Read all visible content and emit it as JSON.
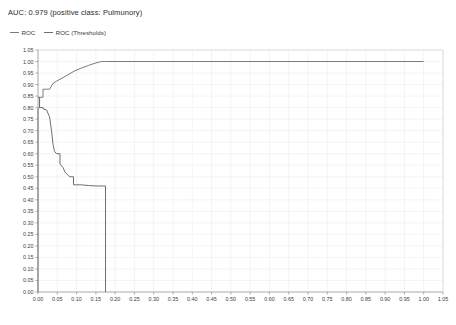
{
  "chart_data": {
    "type": "line",
    "title": "AUC: 0.979 (positive class: Pulmunory)",
    "xlabel": "",
    "ylabel": "",
    "xlim": [
      0.0,
      1.05
    ],
    "ylim": [
      0.0,
      1.05
    ],
    "grid": true,
    "legend_position": "top-left",
    "x_ticks": [
      "0.00",
      "0.05",
      "0.10",
      "0.15",
      "0.20",
      "0.25",
      "0.30",
      "0.35",
      "0.40",
      "0.45",
      "0.50",
      "0.55",
      "0.60",
      "0.65",
      "0.70",
      "0.75",
      "0.80",
      "0.85",
      "0.90",
      "0.95",
      "1.00",
      "1.05"
    ],
    "y_ticks": [
      "0.00",
      "0.05",
      "0.10",
      "0.15",
      "0.20",
      "0.25",
      "0.30",
      "0.35",
      "0.40",
      "0.45",
      "0.50",
      "0.55",
      "0.60",
      "0.65",
      "0.70",
      "0.75",
      "0.80",
      "0.85",
      "0.90",
      "0.95",
      "1.00",
      "1.05"
    ],
    "series": [
      {
        "name": "ROC",
        "color": "#7a7a7a",
        "points": [
          [
            0.0,
            0.0
          ],
          [
            0.0,
            0.795
          ],
          [
            0.004,
            0.8
          ],
          [
            0.004,
            0.845
          ],
          [
            0.013,
            0.845
          ],
          [
            0.013,
            0.88
          ],
          [
            0.022,
            0.88
          ],
          [
            0.03,
            0.88
          ],
          [
            0.039,
            0.905
          ],
          [
            0.048,
            0.915
          ],
          [
            0.057,
            0.923
          ],
          [
            0.07,
            0.935
          ],
          [
            0.083,
            0.948
          ],
          [
            0.096,
            0.96
          ],
          [
            0.113,
            0.972
          ],
          [
            0.131,
            0.983
          ],
          [
            0.148,
            0.993
          ],
          [
            0.165,
            1.0
          ],
          [
            0.175,
            1.0
          ],
          [
            0.3,
            1.0
          ],
          [
            0.5,
            1.0
          ],
          [
            0.7,
            1.0
          ],
          [
            1.0,
            1.0
          ]
        ]
      },
      {
        "name": "ROC (Thresholds)",
        "color": "#6e6e6e",
        "points": [
          [
            0.0,
            0.845
          ],
          [
            0.004,
            0.845
          ],
          [
            0.004,
            0.8
          ],
          [
            0.013,
            0.8
          ],
          [
            0.013,
            0.795
          ],
          [
            0.022,
            0.79
          ],
          [
            0.03,
            0.76
          ],
          [
            0.035,
            0.7
          ],
          [
            0.039,
            0.64
          ],
          [
            0.043,
            0.61
          ],
          [
            0.048,
            0.6
          ],
          [
            0.057,
            0.6
          ],
          [
            0.057,
            0.555
          ],
          [
            0.065,
            0.54
          ],
          [
            0.07,
            0.52
          ],
          [
            0.079,
            0.505
          ],
          [
            0.083,
            0.5
          ],
          [
            0.092,
            0.5
          ],
          [
            0.092,
            0.465
          ],
          [
            0.113,
            0.465
          ],
          [
            0.131,
            0.462
          ],
          [
            0.15,
            0.46
          ],
          [
            0.17,
            0.46
          ],
          [
            0.175,
            0.46
          ],
          [
            0.175,
            0.0
          ]
        ]
      }
    ]
  }
}
